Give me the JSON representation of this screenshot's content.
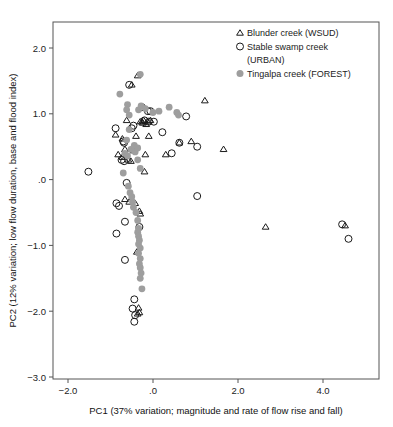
{
  "chart_data": {
    "type": "scatter",
    "title": "",
    "xlabel": "PC1 (37% variation; magnitude and rate of flow rise and fall)",
    "ylabel": "PC2 (12% variation; low flow duration, base and flood index)",
    "xlim": [
      -2.35,
      5.3
    ],
    "ylim": [
      -3.0,
      2.35
    ],
    "xticks": [
      -2.0,
      0.0,
      2.0,
      4.0
    ],
    "xticklabels": [
      "−2.0",
      ".0",
      "2.0",
      "4.0"
    ],
    "yticks": [
      2.0,
      1.0,
      0.0,
      -1.0,
      -2.0,
      -3.0
    ],
    "yticklabels": [
      "2.0",
      "1.0",
      ".0",
      "−1.0",
      "−2.0",
      "−3.0"
    ],
    "grid": false,
    "legend_position": "top-right",
    "colors": {
      "open_marker_stroke": "#1a1a1a",
      "filled_marker_fill": "#9e9e9e",
      "frame": "#555555",
      "background": "#ffffff"
    },
    "series": [
      {
        "name": "Blunder creek (WSUD)",
        "marker": "open-triangle",
        "points": [
          [
            -0.36,
            1.58
          ],
          [
            -0.5,
            1.44
          ],
          [
            -0.62,
            0.9
          ],
          [
            -0.88,
            0.68
          ],
          [
            -0.72,
            0.62
          ],
          [
            -0.66,
            0.46
          ],
          [
            -0.82,
            0.38
          ],
          [
            -0.46,
            0.44
          ],
          [
            -0.4,
            0.66
          ],
          [
            -0.3,
            0.88
          ],
          [
            -0.26,
            0.88
          ],
          [
            -0.22,
            0.9
          ],
          [
            -0.12,
            0.88
          ],
          [
            -0.06,
            0.9
          ],
          [
            -0.1,
            0.66
          ],
          [
            -0.18,
            0.38
          ],
          [
            -0.2,
            0.12
          ],
          [
            0.3,
            0.38
          ],
          [
            0.62,
            0.56
          ],
          [
            0.9,
            0.58
          ],
          [
            1.22,
            1.2
          ],
          [
            1.66,
            0.46
          ],
          [
            -0.52,
            0.28
          ],
          [
            -0.58,
            0.3
          ],
          [
            -0.66,
            -0.3
          ],
          [
            -0.56,
            -0.34
          ],
          [
            -0.42,
            -0.36
          ],
          [
            -0.32,
            -0.48
          ],
          [
            -0.3,
            -0.52
          ],
          [
            -0.38,
            -1.1
          ],
          [
            -0.36,
            -2.04
          ],
          [
            -0.32,
            -2.02
          ],
          [
            -0.34,
            -1.95
          ],
          [
            2.65,
            -0.72
          ],
          [
            4.52,
            -0.7
          ],
          [
            -0.72,
            0.34
          ],
          [
            -0.24,
            0.86
          ],
          [
            -0.16,
            0.84
          ]
        ]
      },
      {
        "name": "Stable swamp creek (URBAN)",
        "marker": "open-circle",
        "points": [
          [
            -0.56,
            1.44
          ],
          [
            -0.88,
            0.78
          ],
          [
            -1.52,
            0.12
          ],
          [
            -0.68,
            0.56
          ],
          [
            -0.7,
            0.58
          ],
          [
            -0.74,
            0.3
          ],
          [
            -0.68,
            0.28
          ],
          [
            -0.5,
            0.78
          ],
          [
            -0.46,
            0.82
          ],
          [
            -0.26,
            1.1
          ],
          [
            -0.12,
            1.04
          ],
          [
            -0.06,
            1.04
          ],
          [
            0.02,
            0.88
          ],
          [
            0.22,
            0.72
          ],
          [
            0.44,
            0.4
          ],
          [
            0.62,
            0.56
          ],
          [
            0.78,
            0.96
          ],
          [
            1.04,
            0.5
          ],
          [
            1.04,
            -0.25
          ],
          [
            -0.86,
            -0.36
          ],
          [
            -0.8,
            -0.4
          ],
          [
            -0.62,
            -0.05
          ],
          [
            -0.66,
            -0.64
          ],
          [
            -0.86,
            -0.82
          ],
          [
            -0.66,
            -1.22
          ],
          [
            -0.32,
            -0.72
          ],
          [
            -0.44,
            -1.82
          ],
          [
            -0.48,
            -1.96
          ],
          [
            -0.42,
            -2.06
          ],
          [
            -0.44,
            -2.16
          ],
          [
            4.45,
            -0.68
          ],
          [
            4.6,
            -0.9
          ],
          [
            -0.2,
            0.9
          ],
          [
            -0.1,
            0.88
          ]
        ]
      },
      {
        "name": "Tingalpa creek (FOREST)",
        "marker": "filled-circle",
        "points": [
          [
            -0.3,
            1.6
          ],
          [
            -0.78,
            1.3
          ],
          [
            -0.6,
            1.14
          ],
          [
            -0.62,
            1.06
          ],
          [
            -0.56,
            0.98
          ],
          [
            -0.56,
            0.76
          ],
          [
            -0.62,
            0.6
          ],
          [
            -0.66,
            0.4
          ],
          [
            -0.6,
            0.36
          ],
          [
            -0.52,
            0.46
          ],
          [
            -0.42,
            0.42
          ],
          [
            -0.36,
            0.3
          ],
          [
            -0.3,
            0.17
          ],
          [
            -0.34,
            1.06
          ],
          [
            -0.28,
            1.12
          ],
          [
            -0.18,
            1.08
          ],
          [
            0.0,
            1.02
          ],
          [
            0.14,
            1.04
          ],
          [
            0.38,
            1.1
          ],
          [
            0.56,
            1.02
          ],
          [
            0.6,
            0.98
          ],
          [
            -0.7,
            0.1
          ],
          [
            -0.58,
            -0.1
          ],
          [
            -0.54,
            -0.2
          ],
          [
            -0.5,
            -0.26
          ],
          [
            -0.48,
            -0.34
          ],
          [
            -0.46,
            -0.42
          ],
          [
            -0.4,
            -0.5
          ],
          [
            -0.36,
            -0.62
          ],
          [
            -0.34,
            -0.74
          ],
          [
            -0.36,
            -0.8
          ],
          [
            -0.34,
            -0.86
          ],
          [
            -0.32,
            -0.92
          ],
          [
            -0.34,
            -0.98
          ],
          [
            -0.3,
            -1.04
          ],
          [
            -0.34,
            -1.12
          ],
          [
            -0.3,
            -1.2
          ],
          [
            -0.32,
            -1.28
          ],
          [
            -0.3,
            -1.34
          ],
          [
            -0.28,
            -1.42
          ],
          [
            -0.3,
            -1.5
          ],
          [
            -0.26,
            -1.66
          ],
          [
            -0.44,
            0.52
          ],
          [
            -0.36,
            0.48
          ]
        ]
      }
    ]
  },
  "legend": {
    "items": [
      {
        "label": "Blunder creek (WSUD)",
        "marker": "open-triangle"
      },
      {
        "label": "Stable swamp creek",
        "label2": "(URBAN)",
        "marker": "open-circle"
      },
      {
        "label": "Tingalpa creek (FOREST)",
        "marker": "filled-circle"
      }
    ]
  }
}
